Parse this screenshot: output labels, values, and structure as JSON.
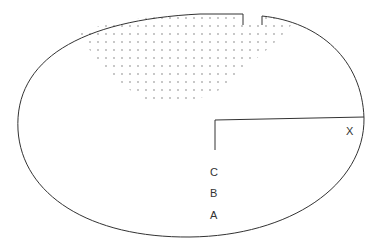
{
  "diagram": {
    "labels": {
      "c": "C",
      "b": "B",
      "a": "A",
      "x": "X"
    },
    "colors": {
      "stroke": "#333333",
      "dots": "#666666",
      "background": "#ffffff"
    }
  }
}
